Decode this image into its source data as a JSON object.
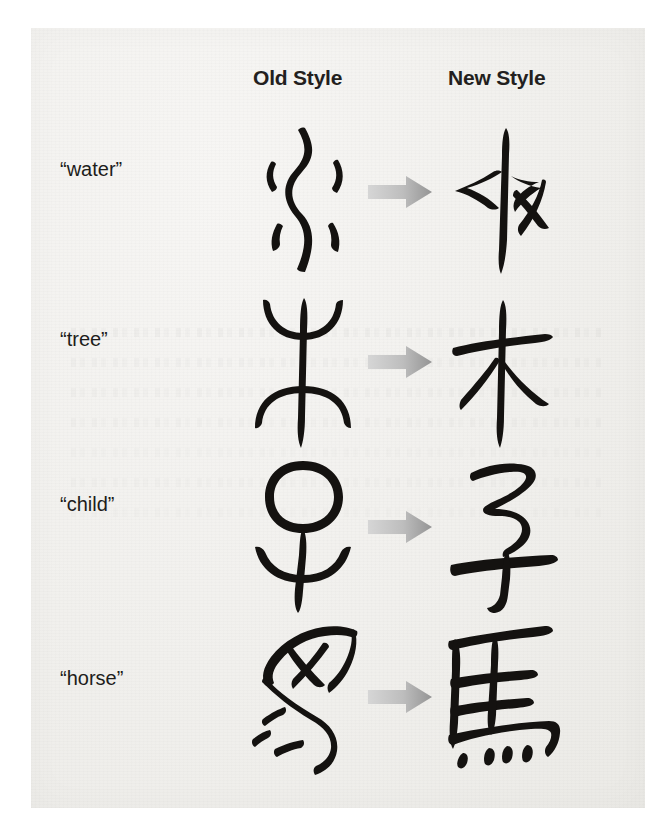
{
  "page": {
    "background_color": "#f3f2f0",
    "ink_color": "#141210",
    "arrow_color_light": "#cfcfcf",
    "arrow_color_dark": "#9a9a9a"
  },
  "headers": {
    "old": "Old Style",
    "new": "New Style"
  },
  "rows": [
    {
      "label": "“water”",
      "meaning": "water",
      "old_glyph_name": "oracle-bone-water-glyph",
      "new_glyph_name": "seal-script-water-glyph",
      "new_character": "水",
      "arrow_name": "transformation-arrow"
    },
    {
      "label": "“tree”",
      "meaning": "tree",
      "old_glyph_name": "oracle-bone-tree-glyph",
      "new_glyph_name": "seal-script-tree-glyph",
      "new_character": "木",
      "arrow_name": "transformation-arrow"
    },
    {
      "label": "“child”",
      "meaning": "child",
      "old_glyph_name": "oracle-bone-child-glyph",
      "new_glyph_name": "seal-script-child-glyph",
      "new_character": "子",
      "arrow_name": "transformation-arrow"
    },
    {
      "label": "“horse”",
      "meaning": "horse",
      "old_glyph_name": "oracle-bone-horse-glyph",
      "new_glyph_name": "seal-script-horse-glyph",
      "new_character": "馬",
      "arrow_name": "transformation-arrow"
    }
  ]
}
